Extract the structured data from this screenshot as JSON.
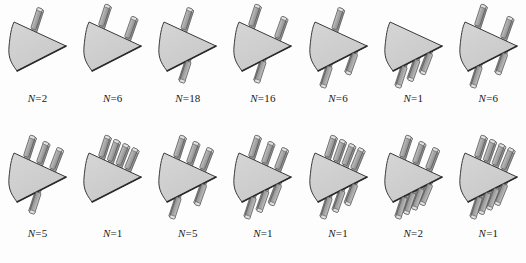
{
  "figure": {
    "background_color": "#fdfdfd",
    "shape_fill": "#c8c8c8",
    "shape_fill_light": "#d6d6d6",
    "shape_edge_color": "#3a3a3a",
    "bar_fill": "#a8a8a8",
    "bar_fill_light": "#c4c4c4",
    "bar_edge_color": "#555555",
    "label_prefix": "N",
    "label_separator": "="
  },
  "rows": [
    {
      "name": "top-row",
      "cells": [
        {
          "label_value": "2",
          "label_text": "N=2",
          "bars_top": 1,
          "bars_bottom": 0,
          "through": false
        },
        {
          "label_value": "6",
          "label_text": "N=6",
          "bars_top": 2,
          "bars_bottom": 0,
          "through": false
        },
        {
          "label_value": "18",
          "label_text": "N=18",
          "bars_top": 1,
          "bars_bottom": 1,
          "through": true
        },
        {
          "label_value": "16",
          "label_text": "N=16",
          "bars_top": 2,
          "bars_bottom": 1,
          "through": true
        },
        {
          "label_value": "6",
          "label_text": "N=6",
          "bars_top": 1,
          "bars_bottom": 2,
          "through": true
        },
        {
          "label_value": "1",
          "label_text": "N=1",
          "bars_top": 0,
          "bars_bottom": 3,
          "through": false
        },
        {
          "label_value": "6",
          "label_text": "N=6",
          "bars_top": 2,
          "bars_bottom": 2,
          "through": true
        }
      ]
    },
    {
      "name": "bottom-row",
      "cells": [
        {
          "label_value": "5",
          "label_text": "N=5",
          "bars_top": 3,
          "bars_bottom": 1,
          "through": true
        },
        {
          "label_value": "1",
          "label_text": "N=1",
          "bars_top": 4,
          "bars_bottom": 0,
          "through": false
        },
        {
          "label_value": "5",
          "label_text": "N=5",
          "bars_top": 3,
          "bars_bottom": 2,
          "through": true
        },
        {
          "label_value": "1",
          "label_text": "N=1",
          "bars_top": 3,
          "bars_bottom": 3,
          "through": true
        },
        {
          "label_value": "1",
          "label_text": "N=1",
          "bars_top": 4,
          "bars_bottom": 3,
          "through": true
        },
        {
          "label_value": "2",
          "label_text": "N=2",
          "bars_top": 3,
          "bars_bottom": 4,
          "through": true
        },
        {
          "label_value": "1",
          "label_text": "N=1",
          "bars_top": 4,
          "bars_bottom": 4,
          "through": true
        }
      ]
    }
  ]
}
